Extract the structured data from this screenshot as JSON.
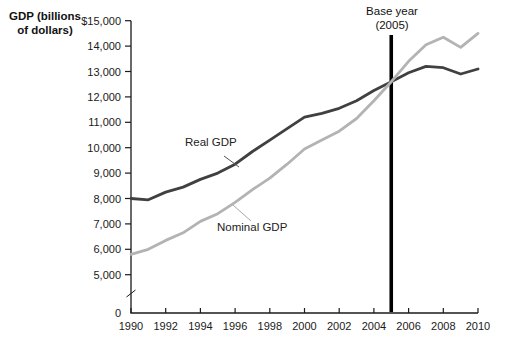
{
  "chart_data": {
    "type": "line",
    "title": "",
    "xlabel": "",
    "ylabel": "GDP (billions of dollars)",
    "ylabel_lines": [
      "GDP (billions",
      "of dollars)"
    ],
    "grid": false,
    "legend_position": "inline-labels",
    "x": [
      1990,
      1991,
      1992,
      1993,
      1994,
      1995,
      1996,
      1997,
      1998,
      1999,
      2000,
      2001,
      2002,
      2003,
      2004,
      2005,
      2006,
      2007,
      2008,
      2009,
      2010
    ],
    "x_axis": {
      "range": [
        1990,
        2010
      ],
      "ticks": [
        1990,
        1992,
        1994,
        1996,
        1998,
        2000,
        2002,
        2004,
        2006,
        2008,
        2010
      ],
      "tick_labels": [
        "1990",
        "1992",
        "1994",
        "1996",
        "1998",
        "2000",
        "2002",
        "2004",
        "2006",
        "2008",
        "2010"
      ]
    },
    "y_axis": {
      "units": "billions of dollars",
      "drawn_range": [
        5000,
        15000
      ],
      "axis_break_between": [
        0,
        5000
      ],
      "ticks": [
        {
          "value": 15000,
          "label": "$15,000"
        },
        {
          "value": 14000,
          "label": "14,000"
        },
        {
          "value": 13000,
          "label": "13,000"
        },
        {
          "value": 12000,
          "label": "12,000"
        },
        {
          "value": 11000,
          "label": "11,000"
        },
        {
          "value": 10000,
          "label": "10,000"
        },
        {
          "value": 9000,
          "label": "9,000"
        },
        {
          "value": 8000,
          "label": "8,000"
        },
        {
          "value": 7000,
          "label": "7,000"
        },
        {
          "value": 6000,
          "label": "6,000"
        },
        {
          "value": 5000,
          "label": "5,000"
        },
        {
          "value": 0,
          "label": "0"
        }
      ]
    },
    "series": [
      {
        "name": "Real GDP",
        "color": "#404040",
        "values": [
          8000,
          7950,
          8250,
          8450,
          8750,
          9000,
          9350,
          9850,
          10300,
          10750,
          11200,
          11350,
          11550,
          11850,
          12250,
          12600,
          12950,
          13200,
          13150,
          12900,
          13100
        ]
      },
      {
        "name": "Nominal GDP",
        "color": "#b3b3b3",
        "values": [
          5800,
          6000,
          6350,
          6650,
          7100,
          7400,
          7850,
          8350,
          8800,
          9350,
          9950,
          10300,
          10650,
          11150,
          11850,
          12600,
          13400,
          14050,
          14350,
          13950,
          14500
        ]
      }
    ],
    "annotation": {
      "line1": "Base year",
      "line2": "(2005)",
      "x": 2005,
      "color": "#000000"
    }
  }
}
